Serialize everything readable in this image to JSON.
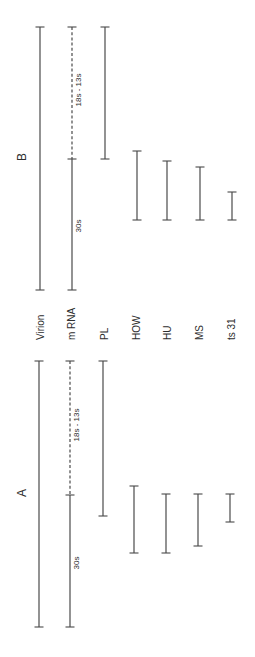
{
  "colors": {
    "line": "#4a4a4a",
    "text": "#2e2e2e",
    "background": "#ffffff"
  },
  "row_labels": [
    {
      "id": "virion",
      "text": "Virion",
      "x": 40
    },
    {
      "id": "mrna",
      "text": "m RNA",
      "x": 71
    },
    {
      "id": "pl",
      "text": "PL",
      "x": 104
    },
    {
      "id": "how",
      "text": "HOW",
      "x": 136
    },
    {
      "id": "hu",
      "text": "HU",
      "x": 167
    },
    {
      "id": "ms",
      "text": "MS",
      "x": 199
    },
    {
      "id": "ts31",
      "text": "ts 31",
      "x": 231
    }
  ],
  "row_label_baseline_y": 340,
  "panels": [
    {
      "id": "B",
      "label": "B",
      "label_pos": {
        "x": 22,
        "y": 157
      },
      "bars": [
        {
          "row": "virion",
          "x": 40,
          "segments": [
            {
              "y1": 27,
              "y2": 290,
              "style": "solid"
            }
          ]
        },
        {
          "row": "mrna",
          "x": 72,
          "segments": [
            {
              "y1": 27,
              "y2": 159,
              "style": "dashed",
              "label": "18s - 13s",
              "label_y": 90
            },
            {
              "y1": 159,
              "y2": 290,
              "style": "solid",
              "label": "30s",
              "label_y": 226
            }
          ]
        },
        {
          "row": "pl",
          "x": 105,
          "segments": [
            {
              "y1": 27,
              "y2": 159,
              "style": "solid"
            }
          ]
        },
        {
          "row": "how",
          "x": 137,
          "segments": [
            {
              "y1": 151,
              "y2": 220,
              "style": "solid"
            }
          ]
        },
        {
          "row": "hu",
          "x": 167,
          "segments": [
            {
              "y1": 161,
              "y2": 220,
              "style": "solid"
            }
          ]
        },
        {
          "row": "ms",
          "x": 200,
          "segments": [
            {
              "y1": 167,
              "y2": 220,
              "style": "solid"
            }
          ]
        },
        {
          "row": "ts31",
          "x": 232,
          "segments": [
            {
              "y1": 192,
              "y2": 220,
              "style": "solid"
            }
          ]
        }
      ]
    },
    {
      "id": "A",
      "label": "A",
      "label_pos": {
        "x": 22,
        "y": 493
      },
      "bars": [
        {
          "row": "virion",
          "x": 39,
          "segments": [
            {
              "y1": 361,
              "y2": 627,
              "style": "solid"
            }
          ]
        },
        {
          "row": "mrna",
          "x": 70,
          "segments": [
            {
              "y1": 361,
              "y2": 495,
              "style": "dashed",
              "label": "18s - 13s",
              "label_y": 425
            },
            {
              "y1": 495,
              "y2": 627,
              "style": "solid",
              "label": "30s",
              "label_y": 563
            }
          ]
        },
        {
          "row": "pl",
          "x": 103,
          "segments": [
            {
              "y1": 361,
              "y2": 516,
              "style": "solid"
            }
          ]
        },
        {
          "row": "how",
          "x": 134,
          "segments": [
            {
              "y1": 486,
              "y2": 553,
              "style": "solid"
            }
          ]
        },
        {
          "row": "hu",
          "x": 166,
          "segments": [
            {
              "y1": 494,
              "y2": 553,
              "style": "solid"
            }
          ]
        },
        {
          "row": "ms",
          "x": 198,
          "segments": [
            {
              "y1": 494,
              "y2": 546,
              "style": "solid"
            }
          ]
        },
        {
          "row": "ts31",
          "x": 230,
          "segments": [
            {
              "y1": 494,
              "y2": 522,
              "style": "solid"
            }
          ]
        }
      ]
    }
  ]
}
